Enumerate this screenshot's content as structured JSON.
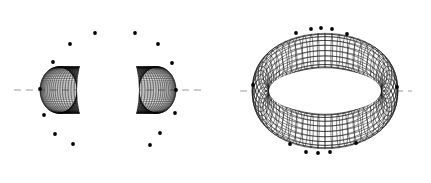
{
  "figure": {
    "background_color": "#ffffff",
    "width": 431,
    "height": 183,
    "axis_line_color": "#9a9a9a",
    "mesh_color": "#141414",
    "marker_color": "#000000"
  },
  "chart_data": {
    "type": "scatter",
    "subtitle": "",
    "xlabel": "",
    "ylabel": "",
    "grid": false,
    "legend_position": "none",
    "panels": [
      {
        "name": "left-view",
        "label": "",
        "view": "face-on",
        "surface": "torus",
        "center": [
          108,
          90
        ],
        "outer_radius_x": 68,
        "outer_radius_y": 85,
        "inner_radius_x": 31,
        "inner_radius_y": 56,
        "mesh_u_lines": 120,
        "mesh_v_lines": 72,
        "axis_line": {
          "orientation": "horizontal",
          "y": 90,
          "x_start": 14,
          "x_end": 205,
          "style": "dashed"
        },
        "markers": [
          [
            70,
            44
          ],
          [
            95,
            33
          ],
          [
            135,
            33
          ],
          [
            158,
            44
          ],
          [
            53,
            62
          ],
          [
            172,
            63
          ],
          [
            44,
            115
          ],
          [
            175,
            113
          ],
          [
            55,
            134
          ],
          [
            160,
            133
          ],
          [
            73,
            144
          ],
          [
            150,
            145
          ],
          [
            40,
            89
          ],
          [
            176,
            90
          ]
        ]
      },
      {
        "name": "right-view",
        "label": "",
        "view": "oblique-edge-on",
        "surface": "torus",
        "center": [
          325,
          91
        ],
        "outer_radius_x": 73,
        "outer_radius_y": 63,
        "inner_radius_x": 56,
        "inner_radius_y": 22,
        "tilt_degrees": 72,
        "mesh_u_lines": 60,
        "mesh_v_lines": 20,
        "axis_line": {
          "orientation": "horizontal",
          "y": 91,
          "x_start": 240,
          "x_end": 412,
          "style": "dashed"
        },
        "markers": [
          [
            311,
            29
          ],
          [
            321,
            28
          ],
          [
            332,
            29
          ],
          [
            296,
            33
          ],
          [
            347,
            34
          ],
          [
            306,
            152
          ],
          [
            318,
            153
          ],
          [
            330,
            152
          ],
          [
            290,
            144
          ],
          [
            356,
            143
          ],
          [
            253,
            85
          ],
          [
            397,
            87
          ]
        ]
      }
    ]
  }
}
